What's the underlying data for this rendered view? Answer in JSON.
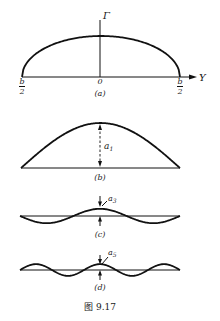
{
  "figure": {
    "caption": "图 9.17",
    "panels": [
      {
        "id": "a",
        "label": "(a)",
        "description": "elliptic circulation distribution",
        "shape": "ellipse",
        "vertical_axis_label": "Γ",
        "horizontal_axis_label": "Y",
        "origin_label": "0",
        "left_end_label": {
          "numerator": "b",
          "denominator": "2"
        },
        "right_end_label": {
          "numerator": "b",
          "denominator": "2"
        }
      },
      {
        "id": "b",
        "label": "(b)",
        "harmonic": 1,
        "sign": 1,
        "relative_amplitude": 1.0,
        "amplitude_label": "a",
        "amplitude_subscript": "1"
      },
      {
        "id": "c",
        "label": "(c)",
        "harmonic": 3,
        "sign": -1,
        "relative_amplitude": 0.16,
        "amplitude_label": "a",
        "amplitude_subscript": "3"
      },
      {
        "id": "d",
        "label": "(d)",
        "harmonic": 5,
        "sign": 1,
        "relative_amplitude": 0.13,
        "amplitude_label": "a",
        "amplitude_subscript": "5"
      }
    ]
  }
}
